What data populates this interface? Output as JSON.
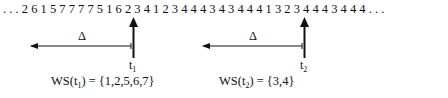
{
  "reference_string": {
    "prefix": ". . .",
    "digits": [
      "2",
      "6",
      "1",
      "5",
      "7",
      "7",
      "7",
      "7",
      "5",
      "1",
      "6",
      "2",
      "3",
      "4",
      "1",
      "2",
      "3",
      "4",
      "4",
      "4",
      "3",
      "4",
      "3",
      "4",
      "4",
      "4",
      "1",
      "3",
      "2",
      "3",
      "4",
      "4",
      "4",
      "3",
      "4",
      "4",
      "4"
    ],
    "suffix": ". . ."
  },
  "windows": [
    {
      "delta_label": "Δ",
      "time_label": "t",
      "time_sub": "1",
      "ws_prefix": "WS(t",
      "ws_sub": "1",
      "ws_suffix": ") = {1,2,5,6,7}"
    },
    {
      "delta_label": "Δ",
      "time_label": "t",
      "time_sub": "2",
      "ws_prefix": "WS(t",
      "ws_sub": "2",
      "ws_suffix": ") = {3,4}"
    }
  ]
}
